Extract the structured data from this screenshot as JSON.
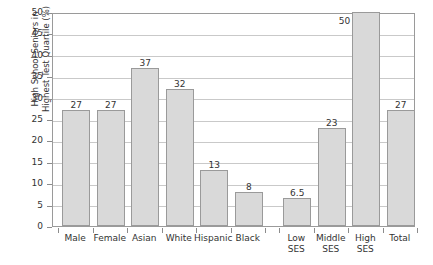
{
  "chart_data": {
    "type": "bar",
    "title": "",
    "xlabel": "",
    "ylabel": "High School Seniors in Highest Test Quartile (%)",
    "ylabel_lines": [
      "High School Seniors in",
      "Highest Test Quartile (%)"
    ],
    "ylim": [
      0,
      50
    ],
    "yticks": [
      0,
      5,
      10,
      15,
      20,
      25,
      30,
      35,
      40,
      45,
      50
    ],
    "ytick_labels": [
      "0",
      "5",
      "10",
      "15",
      "20",
      "25",
      "30",
      "35",
      "40",
      "45",
      "50"
    ],
    "grid": true,
    "legend": "none",
    "categories": [
      "Male",
      "Female",
      "Asian",
      "White",
      "Hispanic",
      "Black",
      "Low SES",
      "Middle SES",
      "High SES",
      "Total"
    ],
    "category_label_lines": [
      [
        "Male"
      ],
      [
        "Female"
      ],
      [
        "Asian"
      ],
      [
        "White"
      ],
      [
        "Hispanic"
      ],
      [
        "Black"
      ],
      [
        "Low",
        "SES"
      ],
      [
        "Middle",
        "SES"
      ],
      [
        "High",
        "SES"
      ],
      [
        "Total"
      ]
    ],
    "values": [
      27,
      27,
      37,
      32,
      13,
      8,
      6.5,
      23,
      50,
      27
    ],
    "value_labels": [
      "27",
      "27",
      "37",
      "32",
      "13",
      "8",
      "6.5",
      "23",
      "50",
      "27"
    ],
    "colors": {
      "bar_fill": "#d9d9d9",
      "bar_border": "#9a9a9a",
      "gridline": "#c9c9c9",
      "axis": "#9a9a9a",
      "text": "#333333",
      "background": "#ffffff"
    }
  }
}
